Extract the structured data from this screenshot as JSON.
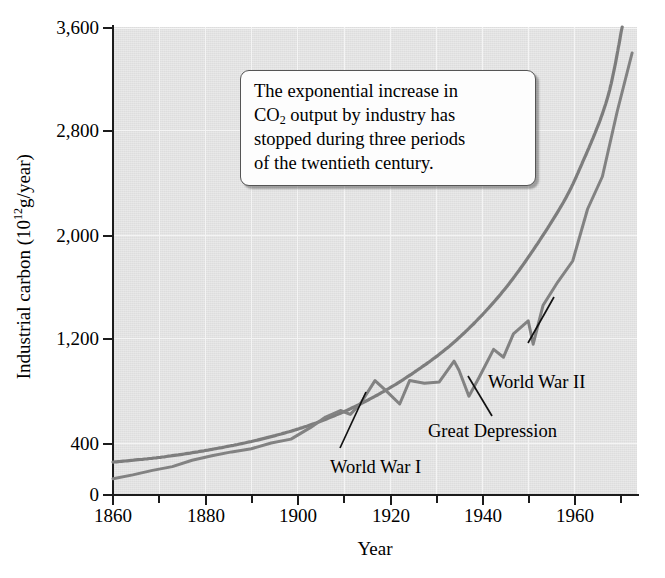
{
  "chart_data": {
    "type": "line",
    "title": "",
    "xlabel": "Year",
    "ylabel": "Industrial carbon (10¹12g/year)",
    "ylabel_text": "Industrial carbon (10",
    "ylabel_exp": "12",
    "ylabel_tail": "g/year)",
    "xlim": [
      1860,
      1966
    ],
    "ylim": [
      0,
      3600
    ],
    "grid": true,
    "legend": "none",
    "y_ticks": [
      0,
      400,
      1200,
      2000,
      2800,
      3600
    ],
    "y_tick_labels": [
      "0",
      "400",
      "1,200",
      "2,000",
      "2,800",
      "3,600"
    ],
    "x_ticks": [
      1860,
      1880,
      1900,
      1920,
      1940,
      1960
    ],
    "x_tick_labels": [
      "1860",
      "1880",
      "1900",
      "1920",
      "1940",
      "1960"
    ],
    "x_minor_ticks": [
      1870,
      1890,
      1910,
      1930,
      1950
    ],
    "axis_note": "y-axis interval 0-400 is compressed relative to 800-unit intervals above",
    "series": [
      {
        "name": "Smooth exponential trend",
        "style": "smooth",
        "color": "#7d7d7d",
        "x": [
          1860,
          1870,
          1880,
          1890,
          1900,
          1910,
          1920,
          1930,
          1940,
          1950,
          1955,
          1960,
          1963
        ],
        "values": [
          250,
          290,
          350,
          430,
          540,
          700,
          920,
          1210,
          1620,
          2180,
          2560,
          3050,
          3600
        ]
      },
      {
        "name": "Industrial carbon output (observed)",
        "style": "jagged",
        "color": "#828282",
        "x": [
          1860,
          1864,
          1868,
          1872,
          1876,
          1880,
          1884,
          1888,
          1892,
          1896,
          1900,
          1903,
          1906,
          1908,
          1910,
          1913,
          1915,
          1918,
          1920,
          1923,
          1926,
          1929,
          1930,
          1932,
          1934,
          1937,
          1939,
          1941,
          1944,
          1945,
          1947,
          1950,
          1953,
          1956,
          1959,
          1962,
          1965
        ],
        "values": [
          120,
          150,
          185,
          215,
          265,
          300,
          330,
          355,
          400,
          430,
          520,
          600,
          650,
          620,
          700,
          880,
          810,
          700,
          880,
          860,
          870,
          1030,
          960,
          760,
          900,
          1120,
          1060,
          1240,
          1340,
          1160,
          1460,
          1640,
          1800,
          2200,
          2450,
          2950,
          3400
        ]
      }
    ],
    "annotations": [
      {
        "label": "World War I",
        "year": 1915,
        "value": 810
      },
      {
        "label": "Great Depression",
        "year": 1932,
        "value": 760
      },
      {
        "label": "World War II",
        "year": 1945,
        "value": 1160
      }
    ],
    "callout": {
      "line1": "The exponential increase in",
      "line2a": "CO",
      "line2sub": "2",
      "line2b": " output by industry has",
      "line3": "stopped during three periods",
      "line4": "of the twentieth century."
    }
  }
}
